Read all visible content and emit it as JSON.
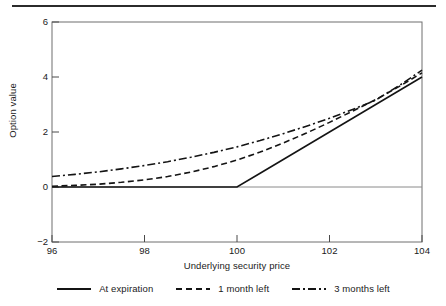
{
  "chart_data": {
    "type": "line",
    "title": "",
    "xlabel": "Underlying security price",
    "ylabel": "Option value",
    "xlim": [
      96,
      104
    ],
    "ylim": [
      -2,
      6
    ],
    "xticks": [
      96,
      98,
      100,
      102,
      104
    ],
    "yticks": [
      -2,
      0,
      2,
      4,
      6
    ],
    "grid": false,
    "legend_position": "bottom",
    "x": [
      96,
      96.5,
      97,
      97.5,
      98,
      98.5,
      99,
      99.5,
      100,
      100.5,
      101,
      101.5,
      102,
      102.5,
      103,
      103.5,
      104
    ],
    "series": [
      {
        "name": "At expiration",
        "style": "solid",
        "color": "#141414",
        "values": [
          0,
          0,
          0,
          0,
          0,
          0,
          0,
          0,
          0,
          0.5,
          1.0,
          1.5,
          2.0,
          2.5,
          3.0,
          3.5,
          4.0
        ]
      },
      {
        "name": "1 month left",
        "style": "dashed",
        "color": "#141414",
        "values": [
          0.03,
          0.06,
          0.1,
          0.17,
          0.26,
          0.38,
          0.54,
          0.74,
          0.98,
          1.27,
          1.6,
          1.96,
          2.35,
          2.76,
          3.18,
          3.65,
          4.15
        ]
      },
      {
        "name": "3 months left",
        "style": "dashdot",
        "color": "#141414",
        "values": [
          0.38,
          0.46,
          0.55,
          0.66,
          0.78,
          0.92,
          1.08,
          1.26,
          1.46,
          1.69,
          1.94,
          2.21,
          2.5,
          2.82,
          3.16,
          3.68,
          4.25
        ]
      }
    ]
  },
  "axis": {
    "ylabel": "Option value",
    "xlabel": "Underlying security price",
    "ytick_labels": [
      "6",
      "4",
      "2",
      "0",
      "−2"
    ],
    "xtick_labels": [
      "96",
      "98",
      "100",
      "102",
      "104"
    ]
  },
  "legend": {
    "items": [
      {
        "label": "At expiration",
        "style": "solid"
      },
      {
        "label": "1 month left",
        "style": "dashed"
      },
      {
        "label": "3 months left",
        "style": "dashdot"
      }
    ]
  },
  "colors": {
    "line": "#141414",
    "axis": "#555555",
    "rule": "#2b2b2b",
    "background": "#ffffff"
  }
}
